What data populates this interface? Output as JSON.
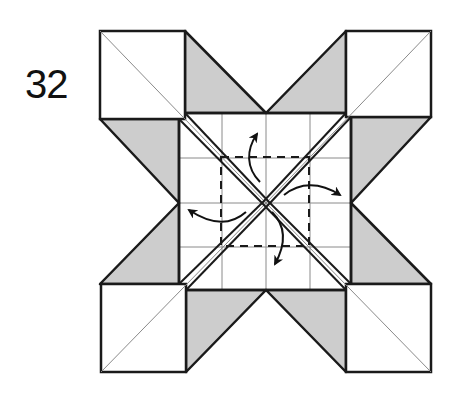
{
  "step": {
    "number": "32"
  },
  "colors": {
    "paper": "#ffffff",
    "shade": "#cdcdcd",
    "line": "#1a1a1a",
    "crease": "#8a8a8a",
    "arrow": "#111111"
  },
  "diagram": {
    "corner_squares": [
      "top-left",
      "top-right",
      "bottom-left",
      "bottom-right"
    ],
    "shaded_flaps": [
      "top-left",
      "top-right",
      "left-upper",
      "left-lower",
      "right-upper",
      "right-lower",
      "bottom-left",
      "bottom-right"
    ],
    "fold_line_style": "dashed",
    "arrows": [
      {
        "direction": "up"
      },
      {
        "direction": "right"
      },
      {
        "direction": "down"
      },
      {
        "direction": "left"
      }
    ]
  }
}
